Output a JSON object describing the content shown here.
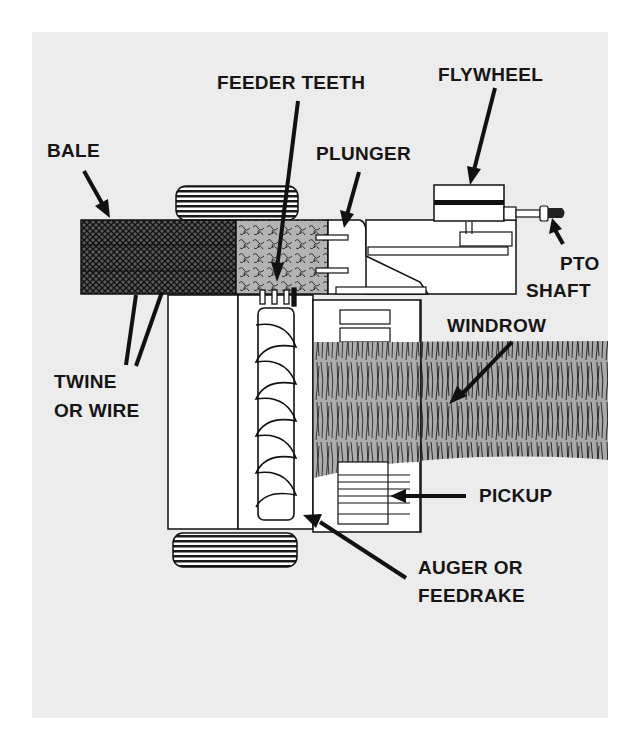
{
  "diagram": {
    "type": "labeled-illustration",
    "labels": {
      "feeder_teeth": "FEEDER TEETH",
      "flywheel": "FLYWHEEL",
      "bale": "BALE",
      "plunger": "PLUNGER",
      "pto_line1": "PTO",
      "pto_line2": "SHAFT",
      "windrow": "WINDROW",
      "twine_line1": "TWINE",
      "twine_line2": "OR WIRE",
      "pickup": "PICKUP",
      "auger_line1": "AUGER OR",
      "auger_line2": "FEEDRAKE"
    },
    "colors": {
      "background": "#ececec",
      "ink": "#151515",
      "windrow_fill": "#a9a9a9",
      "hay_fill": "#b3b3b3",
      "machine_fill": "#ffffff"
    }
  }
}
